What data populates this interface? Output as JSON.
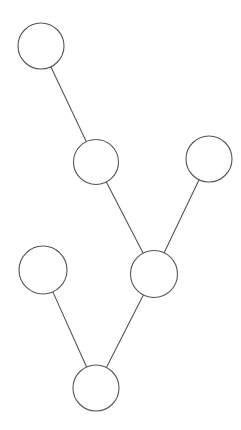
{
  "diagram": {
    "type": "node-link-graph",
    "canvas": {
      "width": 241,
      "height": 430,
      "background": "#ffffff"
    },
    "style": {
      "node_fill": "#ffffff",
      "node_stroke": "#555555",
      "node_stroke_width": 1.1,
      "edge_stroke": "#555555",
      "edge_stroke_width": 1.1,
      "node_shape": "circle"
    },
    "nodes": [
      {
        "id": "A",
        "label": "",
        "cx": 41,
        "cy": 46,
        "r": 23,
        "name": "node-top-left"
      },
      {
        "id": "B",
        "label": "",
        "cx": 96,
        "cy": 162,
        "r": 22.5,
        "name": "node-upper-middle"
      },
      {
        "id": "C",
        "label": "",
        "cx": 209,
        "cy": 159,
        "r": 23,
        "name": "node-top-right"
      },
      {
        "id": "D",
        "label": "",
        "cx": 154,
        "cy": 274,
        "r": 23.5,
        "name": "node-center-hub"
      },
      {
        "id": "E",
        "label": "",
        "cx": 43,
        "cy": 270,
        "r": 24,
        "name": "node-left-lower"
      },
      {
        "id": "F",
        "label": "",
        "cx": 96,
        "cy": 388,
        "r": 23,
        "name": "node-bottom"
      }
    ],
    "edges": [
      {
        "id": "A-B",
        "source": "A",
        "target": "B",
        "name": "edge-top-left-to-upper-middle"
      },
      {
        "id": "B-D",
        "source": "B",
        "target": "D",
        "name": "edge-upper-middle-to-center-hub"
      },
      {
        "id": "C-D",
        "source": "C",
        "target": "D",
        "name": "edge-top-right-to-center-hub"
      },
      {
        "id": "D-F",
        "source": "D",
        "target": "F",
        "name": "edge-center-hub-to-bottom"
      },
      {
        "id": "E-F",
        "source": "E",
        "target": "F",
        "name": "edge-left-lower-to-bottom"
      }
    ],
    "node_count": 6,
    "edge_count": 5
  }
}
